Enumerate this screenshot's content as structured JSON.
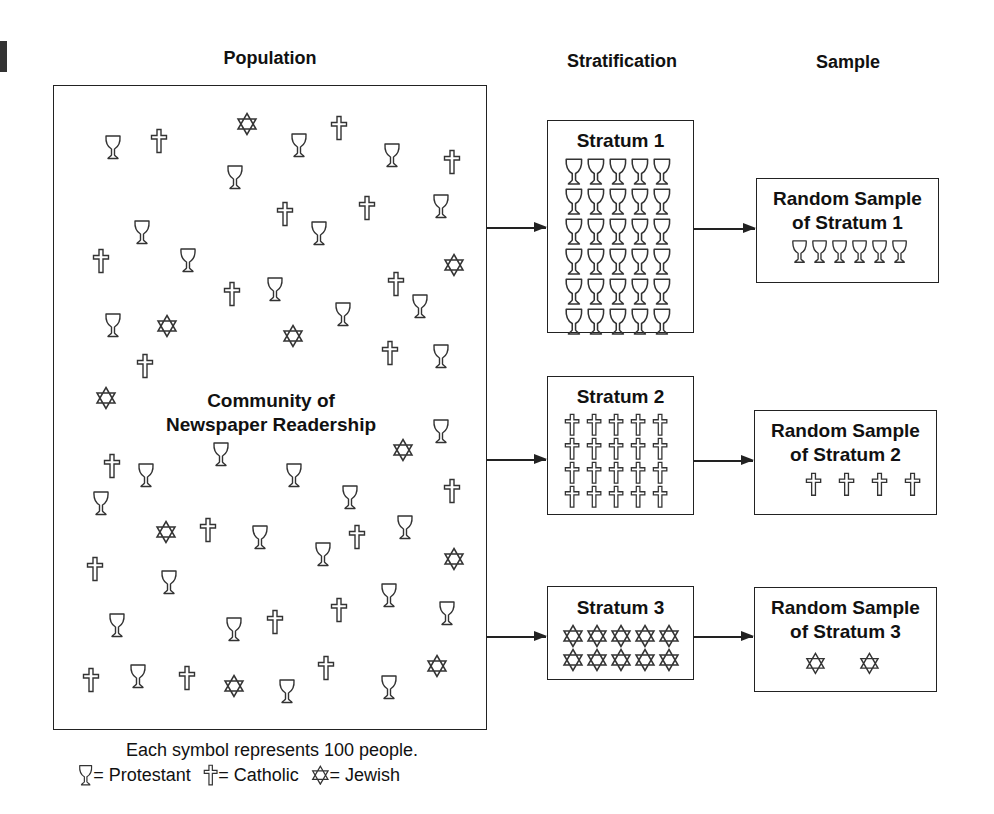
{
  "headers": {
    "population": "Population",
    "stratification": "Stratification",
    "sample": "Sample"
  },
  "population": {
    "label_line1": "Community of",
    "label_line2": "Newspaper Readership",
    "symbols": [
      {
        "t": "P",
        "x": 113,
        "y": 149
      },
      {
        "t": "C",
        "x": 159,
        "y": 143
      },
      {
        "t": "J",
        "x": 247,
        "y": 126
      },
      {
        "t": "P",
        "x": 299,
        "y": 147
      },
      {
        "t": "C",
        "x": 339,
        "y": 130
      },
      {
        "t": "P",
        "x": 392,
        "y": 157
      },
      {
        "t": "C",
        "x": 452,
        "y": 164
      },
      {
        "t": "P",
        "x": 235,
        "y": 179
      },
      {
        "t": "C",
        "x": 285,
        "y": 216
      },
      {
        "t": "C",
        "x": 367,
        "y": 210
      },
      {
        "t": "P",
        "x": 441,
        "y": 208
      },
      {
        "t": "P",
        "x": 142,
        "y": 234
      },
      {
        "t": "P",
        "x": 319,
        "y": 235
      },
      {
        "t": "C",
        "x": 101,
        "y": 263
      },
      {
        "t": "P",
        "x": 188,
        "y": 262
      },
      {
        "t": "J",
        "x": 454,
        "y": 267
      },
      {
        "t": "C",
        "x": 232,
        "y": 296
      },
      {
        "t": "P",
        "x": 275,
        "y": 291
      },
      {
        "t": "C",
        "x": 396,
        "y": 286
      },
      {
        "t": "P",
        "x": 420,
        "y": 308
      },
      {
        "t": "P",
        "x": 343,
        "y": 316
      },
      {
        "t": "P",
        "x": 113,
        "y": 327
      },
      {
        "t": "J",
        "x": 167,
        "y": 328
      },
      {
        "t": "J",
        "x": 293,
        "y": 338
      },
      {
        "t": "C",
        "x": 145,
        "y": 368
      },
      {
        "t": "C",
        "x": 390,
        "y": 355
      },
      {
        "t": "P",
        "x": 441,
        "y": 358
      },
      {
        "t": "J",
        "x": 106,
        "y": 400
      },
      {
        "t": "P",
        "x": 441,
        "y": 433
      },
      {
        "t": "J",
        "x": 403,
        "y": 452
      },
      {
        "t": "P",
        "x": 221,
        "y": 456
      },
      {
        "t": "C",
        "x": 112,
        "y": 468
      },
      {
        "t": "P",
        "x": 146,
        "y": 477
      },
      {
        "t": "P",
        "x": 294,
        "y": 477
      },
      {
        "t": "P",
        "x": 350,
        "y": 499
      },
      {
        "t": "C",
        "x": 452,
        "y": 493
      },
      {
        "t": "P",
        "x": 101,
        "y": 505
      },
      {
        "t": "J",
        "x": 166,
        "y": 534
      },
      {
        "t": "C",
        "x": 208,
        "y": 532
      },
      {
        "t": "P",
        "x": 260,
        "y": 539
      },
      {
        "t": "C",
        "x": 357,
        "y": 539
      },
      {
        "t": "P",
        "x": 405,
        "y": 529
      },
      {
        "t": "P",
        "x": 323,
        "y": 556
      },
      {
        "t": "J",
        "x": 454,
        "y": 561
      },
      {
        "t": "C",
        "x": 95,
        "y": 571
      },
      {
        "t": "P",
        "x": 169,
        "y": 584
      },
      {
        "t": "P",
        "x": 389,
        "y": 597
      },
      {
        "t": "C",
        "x": 339,
        "y": 612
      },
      {
        "t": "P",
        "x": 447,
        "y": 615
      },
      {
        "t": "P",
        "x": 117,
        "y": 627
      },
      {
        "t": "P",
        "x": 234,
        "y": 631
      },
      {
        "t": "C",
        "x": 275,
        "y": 624
      },
      {
        "t": "C",
        "x": 91,
        "y": 682
      },
      {
        "t": "P",
        "x": 138,
        "y": 678
      },
      {
        "t": "C",
        "x": 187,
        "y": 680
      },
      {
        "t": "J",
        "x": 234,
        "y": 688
      },
      {
        "t": "P",
        "x": 287,
        "y": 693
      },
      {
        "t": "C",
        "x": 326,
        "y": 670
      },
      {
        "t": "P",
        "x": 389,
        "y": 689
      },
      {
        "t": "J",
        "x": 437,
        "y": 668
      }
    ]
  },
  "strata": [
    {
      "title": "Stratum 1",
      "symbol": "P",
      "cols": 5,
      "rows": 6,
      "count": 30
    },
    {
      "title": "Stratum 2",
      "symbol": "C",
      "cols": 5,
      "rows": 4,
      "count": 20
    },
    {
      "title": "Stratum 3",
      "symbol": "J",
      "cols": 5,
      "rows": 2,
      "count": 10
    }
  ],
  "samples": [
    {
      "title_line1": "Random Sample",
      "title_line2": "of Stratum 1",
      "symbol": "P",
      "count": 6
    },
    {
      "title_line1": "Random Sample",
      "title_line2": "of Stratum 2",
      "symbol": "C",
      "count": 4
    },
    {
      "title_line1": "Random Sample",
      "title_line2": "of Stratum 3",
      "symbol": "J",
      "count": 2
    }
  ],
  "legend": {
    "note": "Each symbol represents 100 people.",
    "items": [
      {
        "symbol": "P",
        "label": "= Protestant"
      },
      {
        "symbol": "C",
        "label": "= Catholic"
      },
      {
        "symbol": "J",
        "label": "= Jewish"
      }
    ]
  },
  "colors": {
    "stroke": "#333333",
    "text": "#111111",
    "background": "#ffffff"
  }
}
